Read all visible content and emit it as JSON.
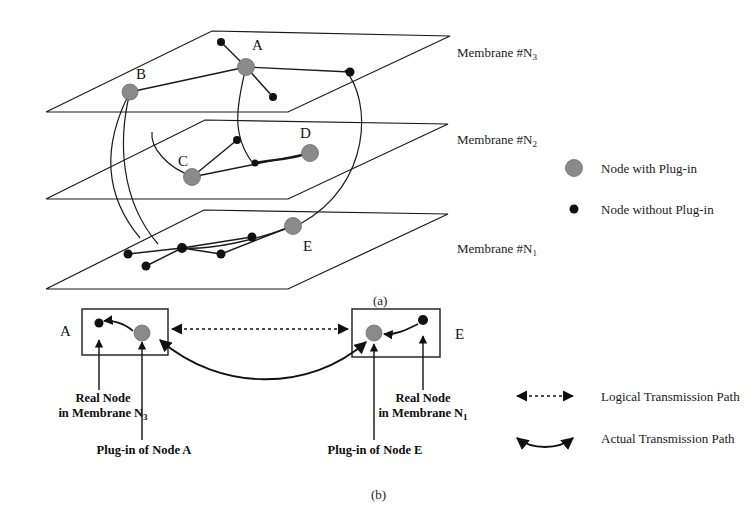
{
  "figure": {
    "panel_a_label": "(a)",
    "panel_b_label": "(b)",
    "membranes": [
      {
        "id": "m3",
        "label": "Membrane #N",
        "subscript": "3"
      },
      {
        "id": "m2",
        "label": "Membrane #N",
        "subscript": "2"
      },
      {
        "id": "m1",
        "label": "Membrane #N",
        "subscript": "1"
      }
    ],
    "nodes": [
      {
        "id": "A",
        "label": "A",
        "type": "plug-in",
        "membrane": "m3"
      },
      {
        "id": "B",
        "label": "B",
        "type": "plug-in",
        "membrane": "m3"
      },
      {
        "id": "C",
        "label": "C",
        "type": "plug-in",
        "membrane": "m2"
      },
      {
        "id": "D",
        "label": "D",
        "type": "plug-in",
        "membrane": "m2"
      },
      {
        "id": "E",
        "label": "E",
        "type": "plug-in",
        "membrane": "m1"
      }
    ],
    "legend_nodes": [
      {
        "marker": "plug-in",
        "label": "Node with Plug-in",
        "color": "#8a8a8a"
      },
      {
        "marker": "no-plug-in",
        "label": "Node without Plug-in",
        "color": "#111111"
      }
    ],
    "legend_paths": [
      {
        "marker": "dashed-double-arrow",
        "label": "Logical Transmission Path"
      },
      {
        "marker": "solid-double-arrow",
        "label": "Actual Transmission Path"
      }
    ],
    "panel_b": {
      "left_box_label": "A",
      "right_box_label": "E",
      "captions": [
        {
          "id": "real-node-left",
          "line1": "Real Node",
          "line2": "in Membrane N",
          "subscript": "3"
        },
        {
          "id": "plugin-left",
          "line1": "Plug-in of Node A"
        },
        {
          "id": "real-node-right",
          "line1": "Real Node",
          "line2": "in Membrane N",
          "subscript": "1"
        },
        {
          "id": "plugin-right",
          "line1": "Plug-in of Node E"
        }
      ]
    },
    "colors": {
      "plug_in_node": "#8a8a8a",
      "plain_node": "#111111",
      "line": "#1a1a1a",
      "background": "#ffffff"
    }
  }
}
